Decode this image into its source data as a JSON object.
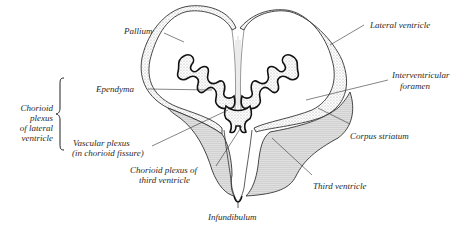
{
  "figure": {
    "type": "anatomical-section",
    "colors": {
      "ink": "#222222",
      "stipple": "#8a8a8a",
      "background": "#ffffff"
    }
  },
  "labels": {
    "pallium": "Pallium",
    "lateral_ventricle": "Lateral ventricle",
    "ependyma": "Ependyma",
    "interventricular_foramen_1": "Interventricular",
    "interventricular_foramen_2": "foramen",
    "chorioid_lateral_1": "Chorioid",
    "chorioid_lateral_2": "plexus",
    "chorioid_lateral_3": "of lateral",
    "chorioid_lateral_4": "ventricle",
    "vascular_plexus_1": "Vascular plexus",
    "vascular_plexus_2": "(in chorioid fissure)",
    "corpus_striatum": "Corpus striatum",
    "chorioid_third_1": "Chorioid plexus of",
    "chorioid_third_2": "third ventricle",
    "third_ventricle": "Third ventricle",
    "infundibulum": "Infundibulum"
  }
}
